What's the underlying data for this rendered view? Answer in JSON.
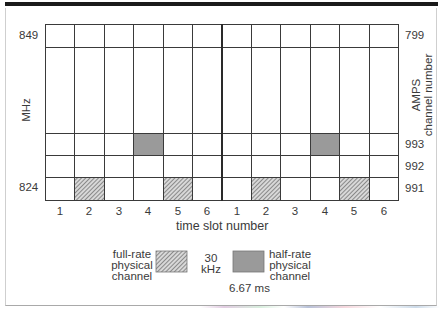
{
  "figure": {
    "left_axis_label": "MHz",
    "right_axis_label_line1": "AMPS",
    "right_axis_label_line2": "channel number",
    "left_ticks": {
      "top": "849",
      "bottom": "824"
    },
    "right_ticks": [
      "799",
      "993",
      "992",
      "991"
    ],
    "time_slot_labels": [
      "1",
      "2",
      "3",
      "4",
      "5",
      "6",
      "1",
      "2",
      "3",
      "4",
      "5",
      "6"
    ],
    "x_axis_label": "time slot number",
    "legend": {
      "full_rate_line1": "full-rate",
      "full_rate_line2": "physical",
      "full_rate_line3": "channel",
      "bandwidth_line1": "30",
      "bandwidth_line2": "kHz",
      "half_rate_line1": "half-rate",
      "half_rate_line2": "physical",
      "half_rate_line3": "channel",
      "slot_duration": "6.67 ms"
    },
    "colors": {
      "grid": "#3a3a3a",
      "half_rate_fill": "#9a9a9a",
      "full_rate_hatch": "#555555",
      "top_bar": "#1a1a1a"
    },
    "highlighted_cells": [
      {
        "channel": "993",
        "frame": 1,
        "slot": 4,
        "type": "half-rate"
      },
      {
        "channel": "993",
        "frame": 2,
        "slot": 4,
        "type": "half-rate"
      },
      {
        "channel": "991",
        "frame": 1,
        "slot": 2,
        "type": "full-rate"
      },
      {
        "channel": "991",
        "frame": 1,
        "slot": 5,
        "type": "full-rate"
      },
      {
        "channel": "991",
        "frame": 2,
        "slot": 2,
        "type": "full-rate"
      },
      {
        "channel": "991",
        "frame": 2,
        "slot": 5,
        "type": "full-rate"
      }
    ]
  }
}
